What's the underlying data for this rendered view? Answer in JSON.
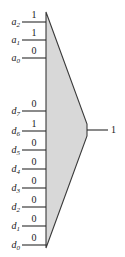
{
  "figure": {
    "kind": "multiplexer-logic-diagram",
    "body_fill": "#d8d8d8",
    "stroke": "#3a3a3a",
    "background": "#ffffff"
  },
  "select_inputs": [
    {
      "name": "a",
      "subscript": "2",
      "value": "1",
      "line_y": 22
    },
    {
      "name": "a",
      "subscript": "1",
      "value": "1",
      "line_y": 40
    },
    {
      "name": "a",
      "subscript": "0",
      "value": "0",
      "line_y": 58
    }
  ],
  "data_inputs": [
    {
      "name": "d",
      "subscript": "7",
      "value": "0",
      "line_y": 111
    },
    {
      "name": "d",
      "subscript": "6",
      "value": "1",
      "line_y": 131
    },
    {
      "name": "d",
      "subscript": "5",
      "value": "0",
      "line_y": 150
    },
    {
      "name": "d",
      "subscript": "4",
      "value": "0",
      "line_y": 169
    },
    {
      "name": "d",
      "subscript": "3",
      "value": "0",
      "line_y": 188
    },
    {
      "name": "d",
      "subscript": "2",
      "value": "0",
      "line_y": 207
    },
    {
      "name": "d",
      "subscript": "1",
      "value": "0",
      "line_y": 226
    },
    {
      "name": "d",
      "subscript": "0",
      "value": "0",
      "line_y": 245
    }
  ],
  "output": {
    "value": "1",
    "line_y": 130
  }
}
